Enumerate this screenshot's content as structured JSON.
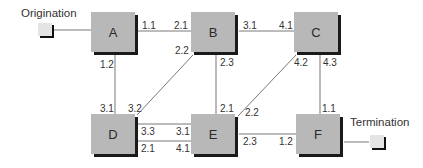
{
  "diagram": {
    "endpoints": {
      "origination": {
        "label": "Origination"
      },
      "termination": {
        "label": "Termination"
      }
    },
    "nodes": [
      {
        "id": "A",
        "label": "A"
      },
      {
        "id": "B",
        "label": "B"
      },
      {
        "id": "C",
        "label": "C"
      },
      {
        "id": "D",
        "label": "D"
      },
      {
        "id": "E",
        "label": "E"
      },
      {
        "id": "F",
        "label": "F"
      }
    ],
    "links": [
      {
        "from": "Origination",
        "to": "A"
      },
      {
        "from": "A",
        "from_port": "1.1",
        "to": "B",
        "to_port": "2.1"
      },
      {
        "from": "A",
        "from_port": "1.2",
        "to": "D",
        "to_port": "3.1"
      },
      {
        "from": "B",
        "from_port": "3.1",
        "to": "C",
        "to_port": "4.1"
      },
      {
        "from": "B",
        "from_port": "2.2",
        "to": "D",
        "to_port": "3.2"
      },
      {
        "from": "B",
        "from_port": "2.3",
        "to": "E",
        "to_port": "2.1"
      },
      {
        "from": "C",
        "from_port": "4.2",
        "to": "E",
        "to_port": "2.2"
      },
      {
        "from": "C",
        "from_port": "4.3",
        "to": "F",
        "to_port": "1.1"
      },
      {
        "from": "D",
        "from_port": "3.3",
        "to": "E",
        "to_port": "3.1"
      },
      {
        "from": "D",
        "from_port": "2.1",
        "to": "E",
        "to_port": "4.1"
      },
      {
        "from": "E",
        "from_port": "2.3",
        "to": "F",
        "to_port": "1.2"
      },
      {
        "from": "F",
        "to": "Termination"
      }
    ],
    "port_labels": {
      "a_b_a": "1.1",
      "a_b_b": "2.1",
      "a_d_a": "1.2",
      "a_d_d": "3.1",
      "b_c_b": "3.1",
      "b_c_c": "4.1",
      "b_d_b": "2.2",
      "b_d_d": "3.2",
      "b_e_b": "2.3",
      "b_e_e": "2.1",
      "c_e_c": "4.2",
      "c_e_e": "2.2",
      "c_f_c": "4.3",
      "c_f_f": "1.1",
      "d_e1_d": "3.3",
      "d_e1_e": "3.1",
      "d_e2_d": "2.1",
      "d_e2_e": "4.1",
      "e_f_e": "2.3",
      "e_f_f": "1.2"
    },
    "colors": {
      "node_fill": "#b8b8b8",
      "node_shadow": "#1a1a1a",
      "line": "#555555",
      "endpoint_fill": "#e4e4e4"
    }
  }
}
